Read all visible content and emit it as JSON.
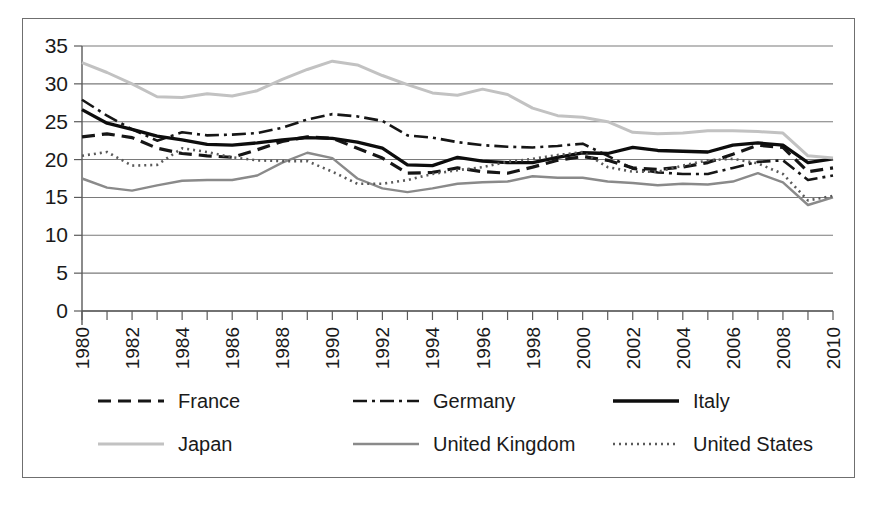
{
  "chart_data": {
    "type": "line",
    "title": "",
    "subtitle": "",
    "xlabel": "",
    "ylabel": "",
    "xlim": [
      1980,
      2010
    ],
    "ylim": [
      0,
      35
    ],
    "grid": true,
    "legend_position": "bottom",
    "y_ticks": [
      "0",
      "5",
      "10",
      "15",
      "20",
      "25",
      "30",
      "35"
    ],
    "y_tick_values": [
      0,
      5,
      10,
      15,
      20,
      25,
      30,
      35
    ],
    "x_ticks": [
      "1980",
      "1982",
      "1984",
      "1986",
      "1988",
      "1990",
      "1992",
      "1994",
      "1996",
      "1998",
      "2000",
      "2002",
      "2004",
      "2006",
      "2008",
      "2010"
    ],
    "x_tick_values": [
      1980,
      1982,
      1984,
      1986,
      1988,
      1990,
      1992,
      1994,
      1996,
      1998,
      2000,
      2002,
      2004,
      2006,
      2008,
      2010
    ],
    "x": [
      1980,
      1981,
      1982,
      1983,
      1984,
      1985,
      1986,
      1987,
      1988,
      1989,
      1990,
      1991,
      1992,
      1993,
      1994,
      1995,
      1996,
      1997,
      1998,
      1999,
      2000,
      2001,
      2002,
      2003,
      2004,
      2005,
      2006,
      2007,
      2008,
      2009,
      2010
    ],
    "series": [
      {
        "name": "France",
        "style": "dashed",
        "color": "#161616",
        "width": 3.2,
        "dash": "13,7",
        "values": [
          23.0,
          23.4,
          22.9,
          21.5,
          20.8,
          20.5,
          20.3,
          21.3,
          22.4,
          23.0,
          22.8,
          21.5,
          20.2,
          18.2,
          18.3,
          18.9,
          18.4,
          18.2,
          19.0,
          19.9,
          20.4,
          19.9,
          18.9,
          18.7,
          19.0,
          19.6,
          20.7,
          21.9,
          21.6,
          18.4,
          18.9
        ]
      },
      {
        "name": "Germany",
        "style": "dash-dot",
        "color": "#161616",
        "width": 2.6,
        "dash": "14,5,3,5",
        "values": [
          27.9,
          25.8,
          24.0,
          22.5,
          23.6,
          23.2,
          23.3,
          23.5,
          24.2,
          25.3,
          26.0,
          25.7,
          25.1,
          23.2,
          22.9,
          22.3,
          21.9,
          21.7,
          21.6,
          21.8,
          22.1,
          20.5,
          18.8,
          18.3,
          18.1,
          18.1,
          18.9,
          19.7,
          19.9,
          17.3,
          17.9
        ]
      },
      {
        "name": "Italy",
        "style": "solid",
        "color": "#0d0d0d",
        "width": 3.3,
        "dash": "",
        "values": [
          26.6,
          24.8,
          24.0,
          23.1,
          22.6,
          22.0,
          21.9,
          22.2,
          22.6,
          22.9,
          22.8,
          22.3,
          21.5,
          19.3,
          19.2,
          20.3,
          19.8,
          19.6,
          19.6,
          20.3,
          20.9,
          20.8,
          21.6,
          21.2,
          21.1,
          21.0,
          21.9,
          22.2,
          21.9,
          19.6,
          20.1
        ]
      },
      {
        "name": "Japan",
        "style": "solid",
        "color": "#c2c2c2",
        "width": 3.0,
        "dash": "",
        "values": [
          32.8,
          31.5,
          30.0,
          28.3,
          28.2,
          28.7,
          28.4,
          29.1,
          30.6,
          31.9,
          33.0,
          32.5,
          31.1,
          29.9,
          28.8,
          28.5,
          29.3,
          28.6,
          26.8,
          25.8,
          25.6,
          25.0,
          23.6,
          23.4,
          23.5,
          23.8,
          23.8,
          23.7,
          23.5,
          20.5,
          20.2
        ]
      },
      {
        "name": "United Kingdom",
        "style": "solid",
        "color": "#8a8a8a",
        "width": 2.4,
        "dash": "",
        "values": [
          17.5,
          16.3,
          15.9,
          16.6,
          17.2,
          17.3,
          17.3,
          17.9,
          19.6,
          20.9,
          20.2,
          17.5,
          16.2,
          15.7,
          16.2,
          16.8,
          17.0,
          17.1,
          17.8,
          17.6,
          17.6,
          17.1,
          16.9,
          16.6,
          16.8,
          16.7,
          17.1,
          18.2,
          17.0,
          14.0,
          15.0
        ]
      },
      {
        "name": "United States",
        "style": "dotted",
        "color": "#5a5a5a",
        "width": 2.6,
        "dash": "2,4",
        "values": [
          20.5,
          21.0,
          19.2,
          19.3,
          21.5,
          21.0,
          20.3,
          19.9,
          19.8,
          19.8,
          18.4,
          16.8,
          16.8,
          17.3,
          18.1,
          18.6,
          19.0,
          19.7,
          20.1,
          20.6,
          21.0,
          19.0,
          18.4,
          18.4,
          19.2,
          19.9,
          20.1,
          19.5,
          18.1,
          14.6,
          15.2
        ]
      }
    ]
  },
  "legend": {
    "items": [
      {
        "label": "France",
        "style": "dashed"
      },
      {
        "label": "Germany",
        "style": "dash-dot"
      },
      {
        "label": "Italy",
        "style": "solid-black"
      },
      {
        "label": "Japan",
        "style": "solid-light-gray"
      },
      {
        "label": "United Kingdom",
        "style": "solid-gray"
      },
      {
        "label": "United States",
        "style": "dotted"
      }
    ]
  },
  "colors": {
    "france": "#161616",
    "germany": "#161616",
    "italy": "#0d0d0d",
    "japan": "#c2c2c2",
    "united_kingdom": "#8a8a8a",
    "united_states": "#5a5a5a",
    "gridline": "#7a7a7a",
    "frame_border": "#6f6f6f",
    "background": "#ffffff"
  }
}
